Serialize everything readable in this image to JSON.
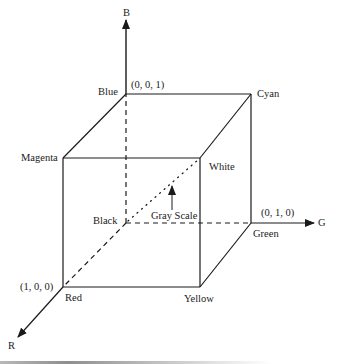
{
  "figure": {
    "axes": {
      "b": "B",
      "g": "G",
      "r": "R"
    },
    "vertices": {
      "blue": {
        "label": "Blue",
        "coord": "(0, 0, 1)"
      },
      "cyan": {
        "label": "Cyan"
      },
      "magenta": {
        "label": "Magenta"
      },
      "white": {
        "label": "White"
      },
      "black": {
        "label": "Black"
      },
      "green": {
        "label": "Green",
        "coord": "(0, 1, 0)"
      },
      "red": {
        "label": "Red",
        "coord": "(1, 0, 0)"
      },
      "yellow": {
        "label": "Yellow"
      }
    },
    "diagonal_label": "Gray Scale",
    "colors": {
      "line": "#1a1a1a",
      "text": "#222222",
      "background": "#ffffff"
    }
  }
}
